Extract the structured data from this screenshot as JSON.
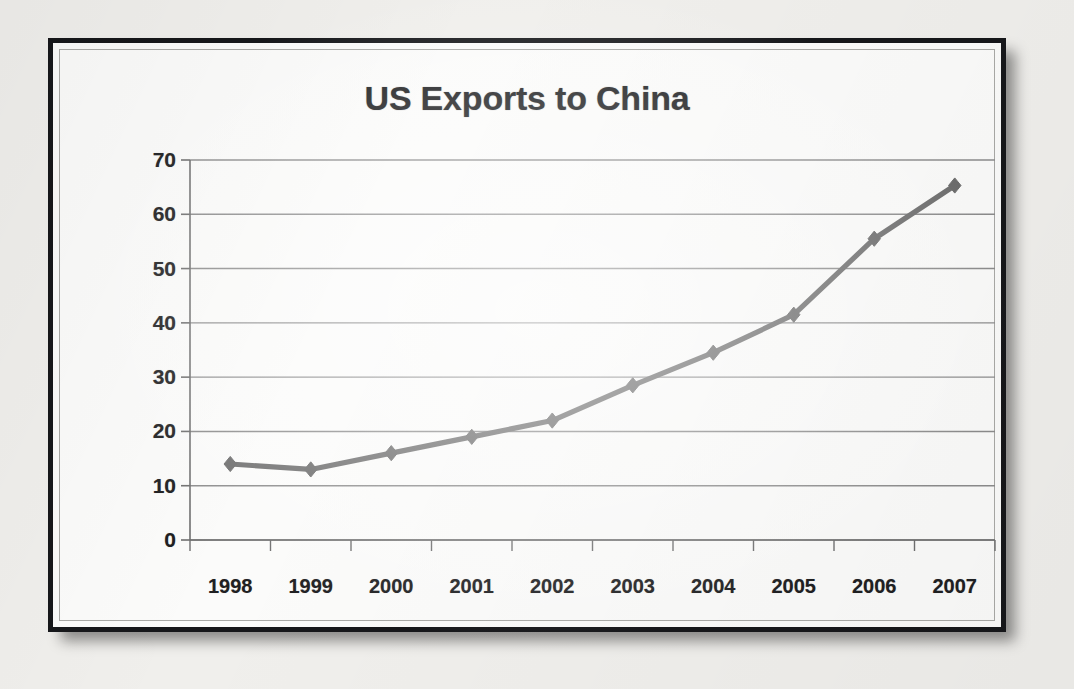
{
  "chart_data": {
    "type": "line",
    "title": "US Exports to China",
    "xlabel": "",
    "ylabel": "",
    "categories": [
      "1998",
      "1999",
      "2000",
      "2001",
      "2002",
      "2003",
      "2004",
      "2005",
      "2006",
      "2007"
    ],
    "values": [
      14,
      13,
      16,
      19,
      22,
      28.5,
      34.5,
      41.5,
      55.5,
      65.3
    ],
    "series": [
      {
        "name": "US Exports to China",
        "values": [
          14,
          13,
          16,
          19,
          22,
          28.5,
          34.5,
          41.5,
          55.5,
          65.3
        ]
      }
    ],
    "ylim": [
      0,
      70
    ],
    "y_ticks": [
      "0",
      "10",
      "20",
      "30",
      "40",
      "50",
      "60",
      "70"
    ],
    "y_tick_values": [
      0,
      10,
      20,
      30,
      40,
      50,
      60,
      70
    ],
    "x_ticks": [
      "1998",
      "1999",
      "2000",
      "2001",
      "2002",
      "2003",
      "2004",
      "2005",
      "2006",
      "2007"
    ],
    "grid": "horizontal",
    "legend": "none",
    "marker": "diamond",
    "line_color": "#6e6e6e",
    "marker_color": "#6b6b6b",
    "gridline_color": "#8c8c8c",
    "axis_color": "#6f6f6f",
    "title_color": "#1b1c1e",
    "plot_background": "#fbfbfa",
    "frame_color": "#16171a"
  }
}
